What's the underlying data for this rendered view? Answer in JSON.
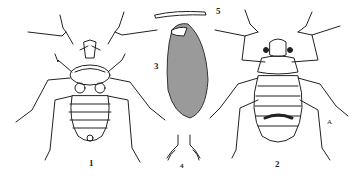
{
  "figure": {
    "panels": [
      {
        "id": "1",
        "label": "1",
        "subject": "insect, ventral view"
      },
      {
        "id": "2",
        "label": "2",
        "subject": "insect, dorsal view"
      },
      {
        "id": "3",
        "label": "3",
        "subject": "egg"
      },
      {
        "id": "4",
        "label": "4",
        "subject": "appendage detail"
      },
      {
        "id": "5",
        "label": "5",
        "subject": "antenna segment / hair detail"
      }
    ],
    "annotation_letter": "A",
    "colors": {
      "ink": "#222222",
      "paper": "#ffffff",
      "egg_fill": "#8a8a8a"
    }
  }
}
